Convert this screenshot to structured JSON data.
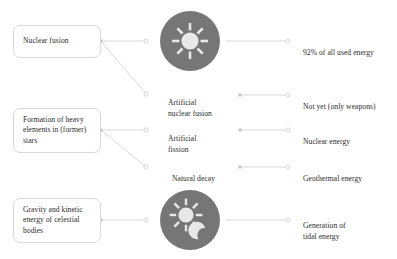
{
  "diagram": {
    "background_color": "#ffffff",
    "badge_color": "#767676",
    "badge_glyph_color": "#e8e8e8",
    "connector_color": "#d9d9d9",
    "box_border_color": "#d8d8d8",
    "text_color": "#2b2b2b"
  },
  "sources": [
    {
      "id": "nuclear-fusion",
      "label": "Nuclear fusion"
    },
    {
      "id": "heavy-elements",
      "label": "Formation of\nheavy elements in\n(former) stars"
    },
    {
      "id": "gravity-kinetic",
      "label": "Gravity and kinetic\nenergy of celestial\nbodies"
    }
  ],
  "mechanisms": [
    {
      "id": "sun",
      "type": "icon",
      "icon": "sun-icon",
      "label": ""
    },
    {
      "id": "artificial-nuclear-fusion",
      "type": "text",
      "label": "Artificial\nnuclear fusion"
    },
    {
      "id": "artificial-fission",
      "type": "text",
      "label": "Artificial\nfission"
    },
    {
      "id": "natural-decay",
      "type": "text",
      "label": "Natural decay"
    },
    {
      "id": "sun-moon",
      "type": "icon",
      "icon": "sun-moon-icon",
      "label": ""
    }
  ],
  "outputs": [
    {
      "id": "all-used-energy",
      "label": "92% of all used energy"
    },
    {
      "id": "not-yet-weapons",
      "label": "Not yet (only weapons)"
    },
    {
      "id": "nuclear-energy",
      "label": "Nuclear energy"
    },
    {
      "id": "geothermal-energy",
      "label": "Geothermal energy"
    },
    {
      "id": "tidal-energy",
      "label": "Generation of\ntidal energy"
    }
  ]
}
